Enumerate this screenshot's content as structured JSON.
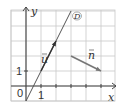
{
  "figure": {
    "type": "vector-line-diagram",
    "axes": {
      "x_label": "x",
      "y_label": "y",
      "origin_label": "0",
      "x_unit_label": "1",
      "y_unit_label": "1",
      "x_range": [
        -1,
        6
      ],
      "y_range": [
        -1,
        5
      ]
    },
    "grid": {
      "step": 1,
      "visible": true
    },
    "line_d": {
      "label": "D",
      "equation": "y = 2x - 1",
      "through": [
        [
          0,
          -1
        ],
        [
          3,
          5
        ]
      ]
    },
    "vector_u": {
      "label": "u",
      "start": [
        1,
        1
      ],
      "end": [
        2,
        3
      ]
    },
    "vector_n": {
      "label": "n",
      "start": [
        3,
        2
      ],
      "end": [
        5,
        1
      ]
    },
    "colors": {
      "grid": "#c8c8c8",
      "axes": "#444444",
      "line": "#555555",
      "vector_u": "#333333",
      "vector_n": "#777777",
      "text": "#333333"
    }
  }
}
